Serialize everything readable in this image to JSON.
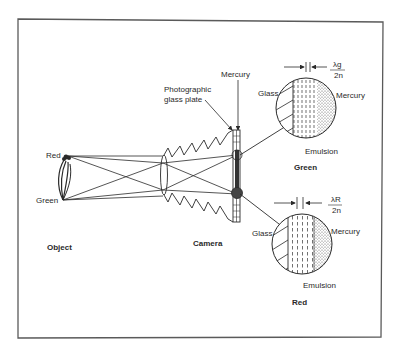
{
  "figure": {
    "labels": {
      "object": "Object",
      "camera": "Camera",
      "red_point": "Red",
      "green_point": "Green",
      "plate": "Photographic glass plate",
      "plate_line1": "Photographic",
      "plate_line2": "glass plate",
      "mercury": "Mercury"
    },
    "insets": [
      {
        "id": "green",
        "caption": "Green",
        "glass": "Glass",
        "mercury": "Mercury",
        "emulsion": "Emulsion",
        "spacing_num": "λg",
        "spacing_den": "2n"
      },
      {
        "id": "red",
        "caption": "Red",
        "glass": "Glass",
        "mercury": "Mercury",
        "emulsion": "Emulsion",
        "spacing_num": "λR",
        "spacing_den": "2n"
      }
    ],
    "colors": {
      "ink": "#2a2a2a",
      "frame": "#5a5a5a",
      "background": "#ffffff"
    }
  }
}
